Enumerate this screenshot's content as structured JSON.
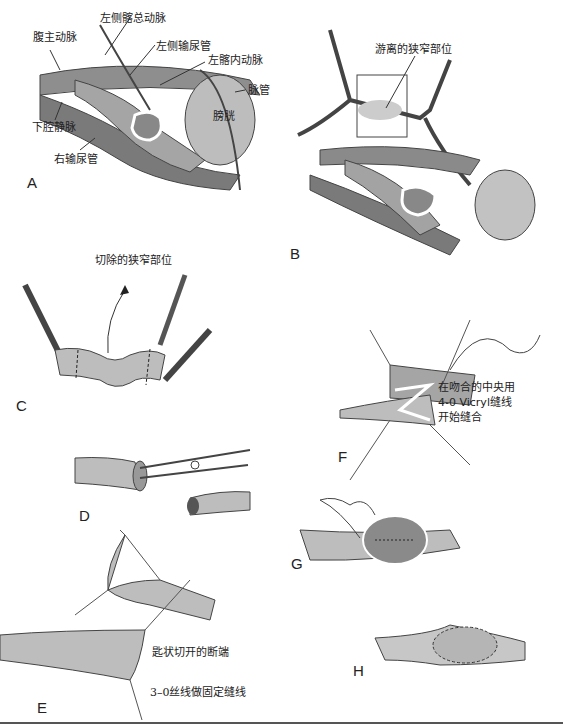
{
  "figure": {
    "panels": [
      {
        "id": "A",
        "letter": "A",
        "labels": [
          "腹主动脉",
          "左侧髂总动脉",
          "左侧输尿管",
          "左髂内动脉",
          "脉管",
          "膀胱",
          "下腔静脉",
          "右输尿管"
        ]
      },
      {
        "id": "B",
        "letter": "B",
        "labels": [
          "游离的狭窄部位"
        ]
      },
      {
        "id": "C",
        "letter": "C",
        "labels": [
          "切除的狭窄部位"
        ]
      },
      {
        "id": "D",
        "letter": "D",
        "labels": []
      },
      {
        "id": "E",
        "letter": "E",
        "labels": [
          "匙状切开的断端",
          "3–0丝线做固定缝线"
        ]
      },
      {
        "id": "F",
        "letter": "F",
        "labels": [
          "在吻合的中央用",
          "4-0 Vicryl缝线",
          "开始缝合"
        ]
      },
      {
        "id": "G",
        "letter": "G",
        "labels": []
      },
      {
        "id": "H",
        "letter": "H",
        "labels": []
      }
    ]
  },
  "colors": {
    "tissue": "#9a9a9a",
    "tissue_light": "#cfcfcf",
    "tissue_dark": "#6e6e6e",
    "line": "#333333",
    "rule": "#555555"
  }
}
